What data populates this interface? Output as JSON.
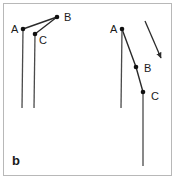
{
  "figure": {
    "panel_label": "b",
    "background_color": "#ffffff",
    "frame_color": "#b8b8b8",
    "stroke_color": "#2b2b2b",
    "label_color": "#1a1a1a"
  },
  "diagrams": [
    {
      "name": "left-diagram",
      "labels": [
        {
          "text": "A",
          "x": 11,
          "y": 33
        },
        {
          "text": "B",
          "x": 64,
          "y": 21
        },
        {
          "text": "C",
          "x": 39,
          "y": 44
        }
      ],
      "vertices": [
        {
          "name": "A",
          "x": 23,
          "y": 29
        },
        {
          "name": "B",
          "x": 57,
          "y": 17
        },
        {
          "name": "C",
          "x": 35,
          "y": 34
        }
      ],
      "segments": [
        {
          "name": "A-to-B",
          "x1": 23,
          "y1": 29,
          "x2": 57,
          "y2": 17
        },
        {
          "name": "C-to-B",
          "x1": 35,
          "y1": 34,
          "x2": 57,
          "y2": 17
        },
        {
          "name": "A-stem",
          "x1": 23,
          "y1": 29,
          "x2": 22,
          "y2": 108
        },
        {
          "name": "C-stem",
          "x1": 35,
          "y1": 34,
          "x2": 34,
          "y2": 108
        }
      ],
      "arrows": []
    },
    {
      "name": "right-diagram",
      "labels": [
        {
          "text": "A",
          "x": 110,
          "y": 33
        },
        {
          "text": "B",
          "x": 144,
          "y": 72
        },
        {
          "text": "C",
          "x": 151,
          "y": 100
        }
      ],
      "vertices": [
        {
          "name": "A",
          "x": 122,
          "y": 29
        },
        {
          "name": "B",
          "x": 136,
          "y": 67
        },
        {
          "name": "C",
          "x": 143,
          "y": 92
        }
      ],
      "segments": [
        {
          "name": "A-to-B",
          "x1": 122,
          "y1": 29,
          "x2": 136,
          "y2": 67
        },
        {
          "name": "B-to-C",
          "x1": 136,
          "y1": 67,
          "x2": 143,
          "y2": 92
        },
        {
          "name": "A-stem",
          "x1": 122,
          "y1": 29,
          "x2": 121,
          "y2": 108
        },
        {
          "name": "C-stem",
          "x1": 143,
          "y1": 92,
          "x2": 143,
          "y2": 166
        }
      ],
      "arrows": [
        {
          "name": "motion-arrow",
          "x1": 145,
          "y1": 21,
          "x2": 163,
          "y2": 62
        }
      ]
    }
  ]
}
